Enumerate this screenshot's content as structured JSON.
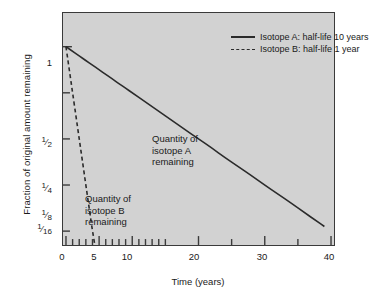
{
  "chart_data": {
    "type": "line",
    "title": "",
    "subtitle": "",
    "xlabel": "Time (years)",
    "ylabel": "Fraction of original amount remaining",
    "xlim": [
      0,
      40
    ],
    "ylim_fraction": [
      0.0625,
      1
    ],
    "y_scale": "log2",
    "grid": false,
    "legend_position": "top-center",
    "x_tick_labels": [
      "0",
      "5",
      "10",
      "20",
      "30",
      "40"
    ],
    "x_tick_values": [
      0,
      5,
      10,
      20,
      30,
      40
    ],
    "x_minor_tick_values": [
      1,
      2,
      3,
      4,
      6,
      7,
      8,
      9,
      11,
      12,
      13,
      14,
      15,
      25,
      35
    ],
    "y_tick_labels": [
      "1",
      "1/2",
      "1/4",
      "1/8",
      "1/16"
    ],
    "y_tick_values": [
      1,
      0.5,
      0.25,
      0.125,
      0.0625
    ],
    "y_tick_numerators": [
      "",
      "1",
      "1",
      "1",
      "1"
    ],
    "y_tick_denominators": [
      "",
      "2",
      "4",
      "8",
      "16"
    ],
    "series": [
      {
        "name": "Isotope A: half-life 10 years",
        "short_name": "Isotope A",
        "half_life_years": 10,
        "style": "solid",
        "color": "#2b2b2b",
        "x": [
          0,
          1,
          2,
          3,
          4,
          5,
          6,
          7,
          8,
          9,
          10,
          12,
          14,
          16,
          18,
          20,
          22,
          24,
          26,
          28,
          30,
          32,
          34,
          36,
          38,
          39
        ],
        "y": [
          1,
          0.933,
          0.871,
          0.812,
          0.758,
          0.707,
          0.66,
          0.616,
          0.574,
          0.536,
          0.5,
          0.435,
          0.379,
          0.33,
          0.287,
          0.25,
          0.218,
          0.189,
          0.165,
          0.144,
          0.125,
          0.109,
          0.095,
          0.0825,
          0.0718,
          0.067
        ]
      },
      {
        "name": "Isotope B: half-life 1 year",
        "short_name": "Isotope B",
        "half_life_years": 1,
        "style": "dashed",
        "color": "#2b2b2b",
        "x": [
          0,
          0.25,
          0.5,
          0.75,
          1,
          1.5,
          2,
          2.5,
          3,
          3.5,
          4,
          5,
          6,
          8,
          10,
          12,
          15
        ],
        "y": [
          1,
          0.841,
          0.707,
          0.595,
          0.5,
          0.354,
          0.25,
          0.177,
          0.125,
          0.0884,
          0.0625,
          0.0313,
          0.0156,
          0.0039,
          0.00098,
          0.00024,
          3e-05
        ]
      }
    ],
    "annotations": [
      {
        "id": "isotope-a-annotation",
        "line1": "Quantity of",
        "line2": "isotope A",
        "line3": "remaining",
        "x_years": 17,
        "y_fraction": 0.42
      },
      {
        "id": "isotope-b-annotation",
        "line1": "Quantity of",
        "line2": "isotope B",
        "line3": "remaining",
        "x_years": 3.5,
        "y_fraction": 0.14
      }
    ]
  },
  "legend": {
    "items": [
      {
        "label": "Isotope A: half-life 10 years",
        "style": "solid"
      },
      {
        "label": "Isotope B: half-life 1 year",
        "style": "dashed"
      }
    ]
  },
  "colors": {
    "page_background": "#ffffff",
    "plot_background": "#d2d2d2",
    "axis": "#3a3a3a",
    "curve": "#2b2b2b",
    "text": "#1a1a1a"
  }
}
